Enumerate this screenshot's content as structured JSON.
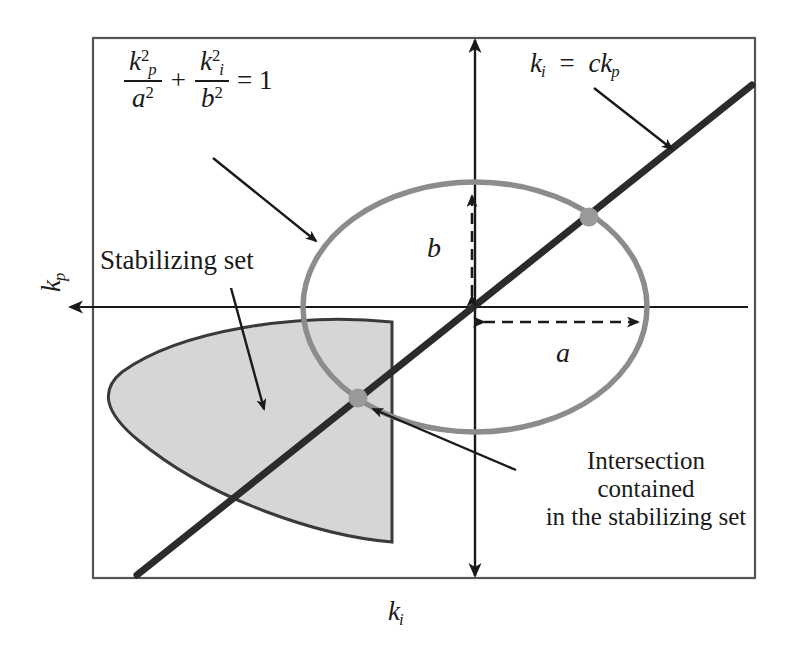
{
  "figure": {
    "kind": "schematic-plot",
    "frame": {
      "x": 93,
      "y": 38,
      "width": 662,
      "height": 540,
      "stroke": "#555555"
    },
    "background": "#ffffff"
  },
  "axes": {
    "x_label": "k",
    "x_label_sub": "i",
    "y_label": "k",
    "y_label_sub": "p",
    "origin": {
      "x": 475,
      "y": 307
    },
    "x_axis_arrow_direction": "left",
    "y_axis_arrow_direction": "up-and-down"
  },
  "equations": {
    "ellipse": {
      "num_left": "k",
      "num_left_sub": "p",
      "num_left_sup": "2",
      "den_left": "a",
      "den_left_sup": "2",
      "operator": "+",
      "num_right": "k",
      "num_right_sub": "i",
      "num_right_sup": "2",
      "den_right": "b",
      "den_right_sup": "2",
      "equals": "= 1"
    },
    "line": {
      "lhs": "k",
      "lhs_sub": "i",
      "equals": "=",
      "rhs_coef": "c",
      "rhs_var": "k",
      "rhs_sub": "p"
    }
  },
  "labels": {
    "stabilizing_set": "Stabilizing set",
    "intersection_line1": "Intersection",
    "intersection_line2": "contained",
    "intersection_line3": "in the stabilizing set",
    "semi_axis_a": "a",
    "semi_axis_b": "b"
  },
  "shapes": {
    "ellipse": {
      "name": "ellipse-boundary",
      "cx": 475,
      "cy": 307,
      "rx": 172,
      "ry": 125,
      "stroke": "#8c8c8c",
      "stroke_width": 5,
      "fill": "none"
    },
    "stabilizing_region": {
      "name": "stabilizing-set-region",
      "fill": "#d6d6d6",
      "stroke": "#3a3a3a",
      "stroke_width": 3,
      "right_edge_x": 392,
      "top_y": 322,
      "bottom_y": 542,
      "left_tip_x": 108
    },
    "line": {
      "name": "line-ki-equals-c-kp",
      "x1": 137,
      "y1": 575,
      "x2": 752,
      "y2": 85,
      "stroke": "#2b2b2b",
      "stroke_width": 7
    },
    "intersection_points": [
      {
        "name": "upper-intersection-dot",
        "cx": 589,
        "cy": 217,
        "r": 9,
        "fill": "#9a9a9a"
      },
      {
        "name": "lower-intersection-dot",
        "cx": 358,
        "cy": 398,
        "r": 9,
        "fill": "#9a9a9a"
      }
    ],
    "dimension_arrows": {
      "a": {
        "from": {
          "x": 478,
          "y": 322
        },
        "to": {
          "x": 645,
          "y": 322
        },
        "style": "dashed-double"
      },
      "b": {
        "from": {
          "x": 472,
          "y": 300
        },
        "to": {
          "x": 472,
          "y": 188
        },
        "style": "dashed-double"
      }
    },
    "annotation_arrows": [
      {
        "name": "ellipse-equation-pointer",
        "from": {
          "x": 215,
          "y": 160
        },
        "to": {
          "x": 318,
          "y": 243
        }
      },
      {
        "name": "line-equation-pointer",
        "from": {
          "x": 595,
          "y": 88
        },
        "to": {
          "x": 672,
          "y": 148
        }
      },
      {
        "name": "stabilizing-set-pointer",
        "from": {
          "x": 232,
          "y": 288
        },
        "to": {
          "x": 264,
          "y": 411
        }
      },
      {
        "name": "intersection-pointer",
        "from": {
          "x": 515,
          "y": 468
        },
        "to": {
          "x": 372,
          "y": 408
        }
      }
    ]
  },
  "colors": {
    "ellipse_stroke": "#8c8c8c",
    "line_stroke": "#2b2b2b",
    "region_fill": "#d6d6d6",
    "frame_stroke": "#555555",
    "text": "#1a1a1a",
    "dot_fill": "#9a9a9a"
  }
}
